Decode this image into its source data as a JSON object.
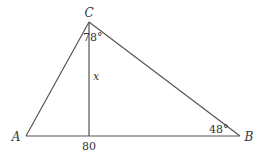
{
  "diagram": {
    "type": "triangle-with-altitude",
    "vertices": {
      "A": {
        "label": "A",
        "x": 26,
        "y": 136
      },
      "B": {
        "label": "B",
        "x": 240,
        "y": 136
      },
      "C": {
        "label": "C",
        "x": 89,
        "y": 22
      }
    },
    "altitude": {
      "label": "x",
      "from": "C",
      "foot_x": 89,
      "foot_y": 136
    },
    "angles": {
      "C": {
        "text": "78°"
      },
      "B": {
        "text": "48°"
      }
    },
    "base_length_label": "80",
    "colors": {
      "line": "#555555",
      "text": "#333333",
      "background": "#ffffff"
    }
  }
}
